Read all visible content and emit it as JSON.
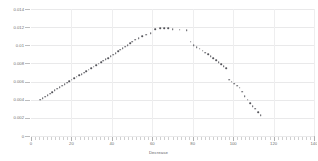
{
  "chart_data": {
    "type": "scatter",
    "title": "",
    "xlabel": "Decrease",
    "ylabel": "Normal distribution",
    "xlim": [
      0,
      140
    ],
    "ylim": [
      0,
      0.014
    ],
    "grid": true,
    "legend": null,
    "marker_color": "#54545a",
    "xticks": [
      0,
      20,
      40,
      60,
      80,
      100,
      120,
      140
    ],
    "xticklabels": [
      "0",
      "20",
      "40",
      "60",
      "80",
      "100",
      "120",
      "140"
    ],
    "yticks": [
      0,
      0.002,
      0.004,
      0.006,
      0.008,
      0.01,
      0.012,
      0.014
    ],
    "yticklabels": [
      "0",
      "0.002",
      "0.004",
      "0.006",
      "0.008",
      "0.01",
      "0.012",
      "0.014"
    ],
    "series": [
      {
        "name": "normal distribution",
        "x": [
          4.5,
          5.8,
          7.0,
          8.2,
          9.4,
          10.6,
          11.8,
          13.0,
          14.2,
          15.4,
          16.6,
          17.8,
          19.0,
          20.2,
          21.4,
          22.6,
          23.8,
          25.0,
          26.2,
          27.4,
          28.6,
          29.8,
          31.0,
          32.2,
          33.4,
          34.6,
          35.8,
          37.0,
          38.2,
          39.4,
          40.6,
          41.8,
          43.0,
          44.2,
          45.4,
          46.6,
          47.8,
          49.0,
          50.2,
          51.6,
          53.2,
          55.0,
          57.0,
          59.2,
          61.5,
          63.8,
          66.0,
          68.0,
          70.0,
          73.5,
          77.0,
          79.0,
          80.5,
          82.0,
          83.5,
          85.0,
          86.3,
          87.6,
          88.9,
          90.2,
          91.5,
          92.8,
          94.1,
          95.4,
          96.7,
          98.0,
          99.3,
          100.6,
          101.9,
          103.2,
          104.5,
          105.8,
          107.1,
          108.4,
          109.7,
          111.0,
          112.3,
          113.6
        ],
        "y": [
          0.004,
          0.00415,
          0.00432,
          0.0045,
          0.00468,
          0.00486,
          0.00503,
          0.0052,
          0.00537,
          0.00554,
          0.00571,
          0.00588,
          0.00604,
          0.0062,
          0.00636,
          0.00652,
          0.00668,
          0.00684,
          0.007,
          0.00716,
          0.00732,
          0.00748,
          0.00764,
          0.0078,
          0.00796,
          0.00812,
          0.00828,
          0.00844,
          0.0086,
          0.00878,
          0.00896,
          0.00914,
          0.00932,
          0.0095,
          0.00968,
          0.00986,
          0.01004,
          0.01022,
          0.0104,
          0.0106,
          0.0108,
          0.011,
          0.01118,
          0.0113,
          0.0118,
          0.01188,
          0.0119,
          0.01186,
          0.0118,
          0.0117,
          0.01165,
          0.0104,
          0.01,
          0.0098,
          0.00962,
          0.0094,
          0.0092,
          0.009,
          0.0088,
          0.00858,
          0.00836,
          0.00814,
          0.00792,
          0.0077,
          0.00748,
          0.0062,
          0.006,
          0.00578,
          0.00556,
          0.00534,
          0.0049,
          0.0044,
          0.004,
          0.0036,
          0.0033,
          0.003,
          0.00265,
          0.0023
        ]
      }
    ]
  },
  "axes": {
    "y_title": "Normal distribution",
    "x_title": "Decrease"
  }
}
